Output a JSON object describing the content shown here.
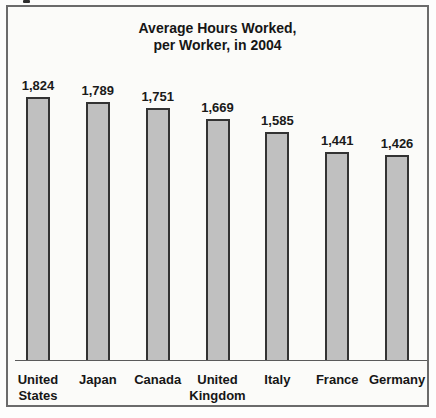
{
  "chart": {
    "title_line1": "Average Hours Worked,",
    "title_line2": "per Worker, in 2004"
  },
  "chart_data": {
    "type": "bar",
    "title": "Average Hours Worked, per Worker, in 2004",
    "categories": [
      "United States",
      "Japan",
      "Canada",
      "United Kingdom",
      "Italy",
      "France",
      "Germany"
    ],
    "category_display": [
      "United\nStates",
      "Japan",
      "Canada",
      "United\nKingdom",
      "Italy",
      "France",
      "Germany"
    ],
    "values": [
      1824,
      1789,
      1751,
      1669,
      1585,
      1441,
      1426
    ],
    "value_labels": [
      "1,824",
      "1,789",
      "1,751",
      "1,669",
      "1,585",
      "1,441",
      "1,426"
    ],
    "xlabel": "",
    "ylabel": "",
    "ylim": [
      0,
      1900
    ],
    "grid": false,
    "legend": false,
    "bar_fill_color": "#c0c0c0",
    "bar_border_color": "#333333",
    "frame_border_color": "#6b6b6b",
    "text_color": "#161616"
  }
}
